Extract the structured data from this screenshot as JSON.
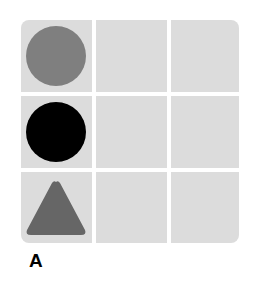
{
  "panel_label": "A",
  "grid": {
    "rows": 3,
    "cols": 3,
    "cell_color": "#dcdcdc",
    "cells": [
      {
        "row": 0,
        "col": 0,
        "shape": "circle",
        "color": "#7f7f7f"
      },
      {
        "row": 1,
        "col": 0,
        "shape": "circle",
        "color": "#000000"
      },
      {
        "row": 2,
        "col": 0,
        "shape": "triangle",
        "color": "#666666"
      }
    ]
  }
}
